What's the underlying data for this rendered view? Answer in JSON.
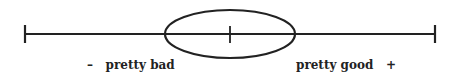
{
  "diagram": {
    "type": "scale-with-ellipse",
    "stroke_color": "#222222",
    "labels": {
      "left_sign": "–",
      "left_text": "pretty bad",
      "right_text": "pretty good",
      "right_sign": "+"
    }
  }
}
